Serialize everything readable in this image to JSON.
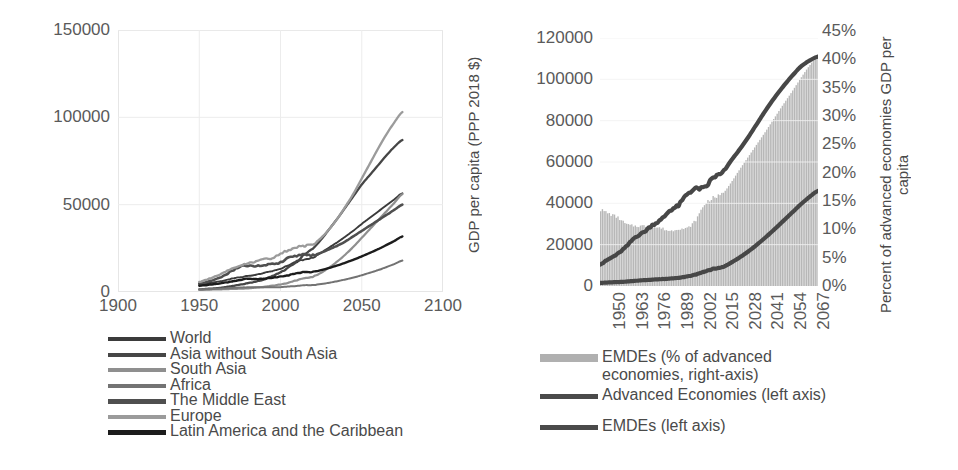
{
  "chart_data": [
    {
      "id": "left",
      "type": "line",
      "title": "",
      "xlabel": "",
      "ylabel": "",
      "xlim": [
        1900,
        2100
      ],
      "ylim": [
        0,
        150000
      ],
      "xticks": [
        "1900",
        "1950",
        "2000",
        "2050",
        "2100"
      ],
      "xtick_values": [
        1900,
        1950,
        2000,
        2050,
        2100
      ],
      "yticks": [
        "0",
        "50000",
        "100000",
        "150000"
      ],
      "ytick_values": [
        0,
        50000,
        100000,
        150000
      ],
      "grid": true,
      "legend_position": "below",
      "x": [
        1950,
        1955,
        1960,
        1965,
        1970,
        1975,
        1980,
        1985,
        1990,
        1995,
        2000,
        2005,
        2010,
        2015,
        2020,
        2025,
        2030,
        2035,
        2040,
        2045,
        2050,
        2055,
        2060,
        2065,
        2070,
        2075
      ],
      "series": [
        {
          "name": "World",
          "color": "#3b3b3b",
          "values": [
            4200,
            4900,
            5600,
            6500,
            7600,
            8400,
            9300,
            9900,
            11000,
            12000,
            13500,
            15200,
            17200,
            18800,
            20000,
            22500,
            25500,
            28500,
            31800,
            35200,
            39000,
            42500,
            46000,
            49500,
            53000,
            56500
          ]
        },
        {
          "name": "Asia without South Asia",
          "color": "#464646",
          "values": [
            1500,
            1800,
            2100,
            2600,
            3400,
            4200,
            5000,
            6000,
            7300,
            9200,
            11200,
            14000,
            17500,
            21500,
            25000,
            30000,
            36000,
            42000,
            48500,
            55000,
            61500,
            67000,
            72500,
            78000,
            83000,
            87000
          ]
        },
        {
          "name": "South Asia",
          "color": "#8f8f8f",
          "values": [
            1200,
            1300,
            1450,
            1600,
            1750,
            1900,
            2100,
            2500,
            3000,
            3600,
            4300,
            5300,
            6700,
            8000,
            8800,
            11000,
            14000,
            17500,
            21500,
            26000,
            31000,
            36000,
            41000,
            46000,
            51000,
            56000
          ]
        },
        {
          "name": "Africa",
          "color": "#737373",
          "values": [
            1400,
            1600,
            1800,
            2000,
            2300,
            2500,
            2700,
            2700,
            2700,
            2700,
            2800,
            3100,
            3500,
            3900,
            4000,
            4600,
            5300,
            6200,
            7200,
            8300,
            9600,
            11000,
            12500,
            14200,
            16000,
            18000
          ]
        },
        {
          "name": "The Middle East",
          "color": "#4f4f4f",
          "values": [
            4800,
            5900,
            7300,
            9300,
            12000,
            14500,
            15000,
            14800,
            15500,
            16000,
            17000,
            19500,
            20800,
            21500,
            21000,
            22500,
            24500,
            26500,
            29000,
            32000,
            35000,
            38000,
            41000,
            44000,
            47000,
            50000
          ]
        },
        {
          "name": "Europe",
          "color": "#9b9b9b",
          "values": [
            5800,
            7200,
            9000,
            11000,
            13500,
            15000,
            16500,
            17500,
            19000,
            19500,
            22000,
            24000,
            25500,
            26500,
            27500,
            31000,
            36000,
            42000,
            49000,
            56500,
            65000,
            73500,
            82000,
            90000,
            97000,
            103000
          ]
        },
        {
          "name": "Latin America and the Caribbean",
          "color": "#1c1c1c",
          "values": [
            3600,
            4100,
            4500,
            5200,
            6000,
            6900,
            7600,
            7400,
            7700,
            8200,
            8900,
            9600,
            10800,
            11500,
            11500,
            12500,
            13800,
            15200,
            16800,
            18500,
            20400,
            22400,
            24500,
            26800,
            29200,
            31800
          ]
        }
      ],
      "legend": [
        {
          "label": "World",
          "color": "#3b3b3b"
        },
        {
          "label": "Asia without South Asia",
          "color": "#464646"
        },
        {
          "label": "South Asia",
          "color": "#8f8f8f"
        },
        {
          "label": "Africa",
          "color": "#737373"
        },
        {
          "label": "The Middle East",
          "color": "#4f4f4f"
        },
        {
          "label": "Europe",
          "color": "#9b9b9b"
        },
        {
          "label": "Latin America and the Caribbean",
          "color": "#1c1c1c"
        }
      ]
    },
    {
      "id": "right",
      "type": "line",
      "title": "",
      "xlabel": "",
      "ylabel": "GDP per capita (PPP 2018 $)",
      "y2label": "Percent of advanced economies GDP per\ncapita",
      "xlim": [
        1950,
        2075
      ],
      "ylim": [
        0,
        120000
      ],
      "y2lim": [
        0,
        45
      ],
      "xticks": [
        "1950",
        "1963",
        "1976",
        "1989",
        "2002",
        "2015",
        "2028",
        "2041",
        "2054",
        "2067"
      ],
      "xtick_values": [
        1950,
        1963,
        1976,
        1989,
        2002,
        2015,
        2028,
        2041,
        2054,
        2067
      ],
      "yticks": [
        "0",
        "20000",
        "40000",
        "60000",
        "80000",
        "100000",
        "120000"
      ],
      "ytick_values": [
        0,
        20000,
        40000,
        60000,
        80000,
        100000,
        120000
      ],
      "y2ticks": [
        "0%",
        "5%",
        "10%",
        "15%",
        "20%",
        "25%",
        "30%",
        "35%",
        "40%",
        "45%"
      ],
      "y2tick_values": [
        0,
        5,
        10,
        15,
        20,
        25,
        30,
        35,
        40,
        45
      ],
      "grid": true,
      "legend_position": "below",
      "x": [
        1950,
        1955,
        1960,
        1965,
        1970,
        1975,
        1980,
        1985,
        1990,
        1995,
        2000,
        2005,
        2010,
        2015,
        2020,
        2025,
        2030,
        2035,
        2040,
        2045,
        2050,
        2055,
        2060,
        2065,
        2070,
        2075
      ],
      "series": [
        {
          "name": "Advanced Economies (left axis)",
          "axis": "left",
          "color": "#4a4a4a",
          "values": [
            10500,
            13000,
            15500,
            19000,
            23500,
            26000,
            29500,
            32000,
            36500,
            39000,
            44500,
            47000,
            47500,
            52500,
            54500,
            60500,
            66000,
            72000,
            78500,
            85000,
            91000,
            96500,
            101500,
            106000,
            109000,
            111000
          ]
        },
        {
          "name": "EMDEs (left axis)",
          "axis": "left",
          "color": "#4a4a4a",
          "values": [
            1500,
            1700,
            1900,
            2100,
            2500,
            2800,
            3100,
            3300,
            3600,
            4000,
            4600,
            5600,
            7000,
            8300,
            9000,
            11200,
            13800,
            16700,
            20000,
            23600,
            27400,
            31400,
            35400,
            39400,
            43000,
            46000
          ]
        },
        {
          "name": "EMDEs (% of advanced economies, right-axis)",
          "axis": "right",
          "type": "bar",
          "color": "#b0b0b0",
          "values": [
            13.8,
            13.1,
            12.4,
            11.2,
            10.9,
            10.9,
            10.7,
            10.5,
            10.0,
            10.4,
            10.5,
            12.0,
            14.8,
            16.0,
            16.6,
            18.6,
            21.0,
            23.3,
            25.6,
            27.9,
            30.3,
            32.7,
            35.0,
            37.4,
            39.7,
            41.5
          ]
        }
      ],
      "legend": [
        {
          "label": "EMDEs (% of advanced\neconomies, right-axis)",
          "color": "#b0b0b0",
          "kind": "bar"
        },
        {
          "label": "Advanced Economies (left axis)",
          "color": "#4a4a4a",
          "kind": "line"
        },
        {
          "label": "EMDEs (left axis)",
          "color": "#4a4a4a",
          "kind": "line"
        }
      ]
    }
  ]
}
